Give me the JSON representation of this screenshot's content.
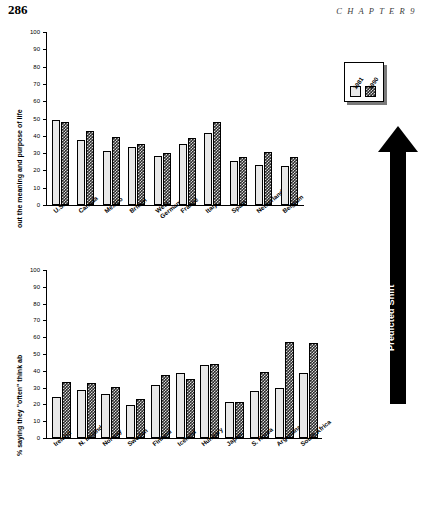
{
  "page": {
    "folio": "286",
    "running_head": "C H A P T E R   9"
  },
  "legend": {
    "series": [
      {
        "label": "1981",
        "pattern": "light-stipple"
      },
      {
        "label": "1990",
        "pattern": "dark-checker"
      }
    ]
  },
  "annotation": {
    "predicted_shift_label": "Predicted Shift"
  },
  "y_axis": {
    "title_top": "% saying they \"often\" think about the meaning and purpose of life",
    "title_part_bottom": "% saying they \"often\" think ab",
    "title_part_top": "out the meaning and purpose of life",
    "ticks": [
      "0",
      "10",
      "20",
      "30",
      "40",
      "50",
      "60",
      "70",
      "80",
      "90",
      "100"
    ]
  },
  "chart_data": [
    {
      "type": "bar",
      "id": "chart-top",
      "title": "",
      "xlabel": "",
      "ylabel": "% saying they \"often\" think about the meaning and purpose of life",
      "ylim": [
        0,
        100
      ],
      "yticks": [
        0,
        10,
        20,
        30,
        40,
        50,
        60,
        70,
        80,
        90,
        100
      ],
      "grid": false,
      "legend_position": "top-right",
      "categories": [
        "U.S.",
        "Canada",
        "Mexico",
        "Britain",
        "West Germany",
        "France",
        "Italy",
        "Spain",
        "Netherlands",
        "Belgium"
      ],
      "series": [
        {
          "name": "1981",
          "values": [
            49,
            37.5,
            31.5,
            33.5,
            28.5,
            35.5,
            41.5,
            25.5,
            23,
            22.5
          ]
        },
        {
          "name": "1990",
          "values": [
            48,
            43,
            39.5,
            35.5,
            30,
            38.5,
            48,
            28,
            30.5,
            28
          ]
        }
      ]
    },
    {
      "type": "bar",
      "id": "chart-bottom",
      "title": "",
      "xlabel": "",
      "ylabel": "% saying they \"often\" think about the meaning and purpose of life",
      "ylim": [
        0,
        100
      ],
      "yticks": [
        0,
        10,
        20,
        30,
        40,
        50,
        60,
        70,
        80,
        90,
        100
      ],
      "grid": false,
      "legend_position": "none",
      "categories": [
        "Ireland",
        "N. Ireland",
        "Norway",
        "Sweden",
        "Finland",
        "Iceland",
        "Hungary",
        "Japan",
        "S. Korea",
        "Argentina",
        "South Africa"
      ],
      "series": [
        {
          "name": "1981",
          "values": [
            24.5,
            28.5,
            26,
            19.5,
            31.5,
            38.5,
            43.5,
            21.5,
            28,
            30,
            38.5
          ]
        },
        {
          "name": "1990",
          "values": [
            33.5,
            32.5,
            30.5,
            23.5,
            37.5,
            35,
            44,
            21.5,
            39.5,
            57,
            56.5
          ]
        }
      ]
    }
  ]
}
